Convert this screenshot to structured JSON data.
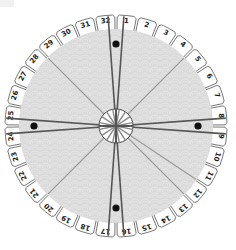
{
  "diagram": {
    "type": "numbered-wheel",
    "center": [
      116,
      126
    ],
    "outer_radius": 111,
    "tab_inner_radius": 96,
    "disc_radius": 97,
    "hub_radius": 17,
    "segment_count": 32,
    "labels": [
      "1",
      "2",
      "3",
      "4",
      "5",
      "6",
      "7",
      "8",
      "9",
      "10",
      "11",
      "12",
      "13",
      "14",
      "15",
      "16",
      "17",
      "18",
      "19",
      "20",
      "21",
      "22",
      "23",
      "24",
      "25",
      "26",
      "27",
      "28",
      "29",
      "30",
      "31",
      "32"
    ],
    "highlighted_spokes": [
      {
        "from_segment": "32",
        "to_segment": "1",
        "dot": true
      },
      {
        "from_segment": "8",
        "to_segment": "9",
        "dot": true
      },
      {
        "from_segment": "16",
        "to_segment": "17",
        "dot": true
      },
      {
        "from_segment": "24",
        "to_segment": "25",
        "dot": true
      }
    ],
    "light_spoke_boundaries": [
      "4|5",
      "11|12",
      "12|13",
      "20|21",
      "28|29"
    ],
    "colors": {
      "tab_fill": "#ffffff",
      "tab_stroke": "#555555",
      "disc_fill": "#d9d9d9",
      "disc_pattern": "#e6e6e6",
      "dark_spoke": "#555555",
      "light_spoke": "#9a9a9a",
      "dot": "#111111",
      "hub_fill": "#ffffff",
      "hub_stroke": "#444444"
    }
  }
}
